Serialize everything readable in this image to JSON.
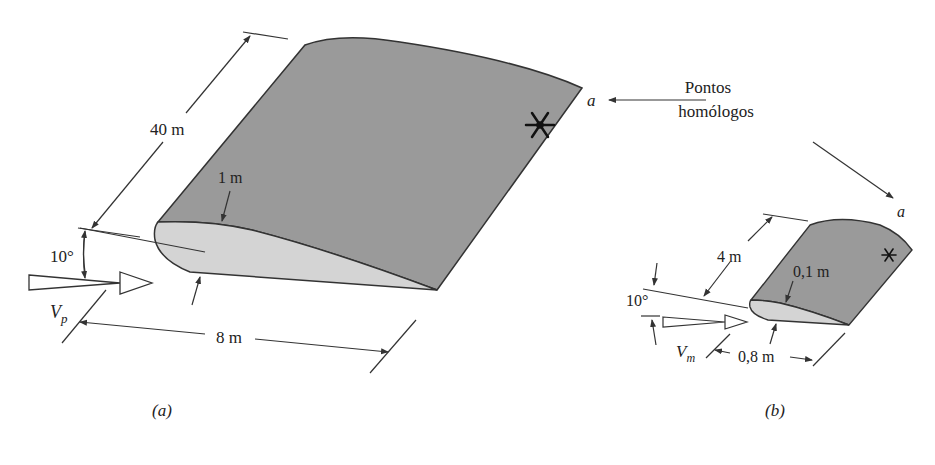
{
  "figure": {
    "colors": {
      "top_surface": "#9a9a9a",
      "section_face": "#d4d4d4",
      "line": "#333333",
      "text": "#222222"
    },
    "prototype": {
      "panel_label": "(a)",
      "span_label": "40 m",
      "thickness_label": "1 m",
      "angle_label": "10°",
      "chord_label": "8 m",
      "velocity_symbol": "V",
      "velocity_subscript": "p",
      "point_label": "a",
      "point_marker": "asterisk"
    },
    "model": {
      "panel_label": "(b)",
      "span_label": "4 m",
      "thickness_label": "0,1 m",
      "angle_label": "10°",
      "chord_label": "0,8 m",
      "velocity_symbol": "V",
      "velocity_subscript": "m",
      "point_label": "a",
      "point_marker": "asterisk"
    },
    "annotation": {
      "line1": "Pontos",
      "line2": "homólogos"
    }
  }
}
